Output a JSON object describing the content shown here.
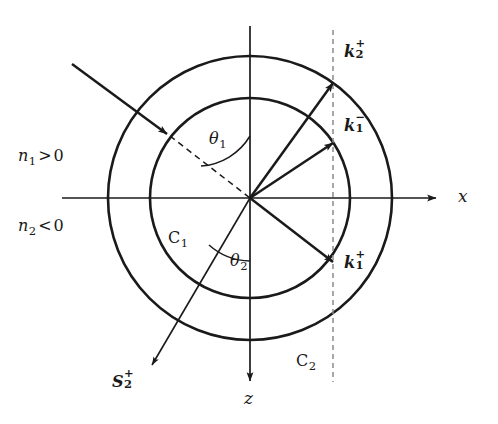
{
  "figure": {
    "kind": "wavevector-diagram",
    "colors": {
      "stroke": "#1a1a1a",
      "background": "#ffffff",
      "dashed_guide": "#8a8a8a"
    }
  },
  "axes": {
    "x_label": "x",
    "z_label": "z",
    "origin": {
      "x": 250,
      "y": 198
    }
  },
  "media": {
    "upper": {
      "label_prefix": "n",
      "label_sub": "1",
      "relation": ">",
      "value": "0",
      "full": "n1 > 0"
    },
    "lower": {
      "label_prefix": "n",
      "label_sub": "2",
      "relation": "<",
      "value": "0",
      "full": "n2 < 0"
    }
  },
  "circles": [
    {
      "name": "C1",
      "label_prefix": "C",
      "label_sub": "1",
      "radius": 100,
      "label_x": 168,
      "label_y": 230
    },
    {
      "name": "C2",
      "label_prefix": "C",
      "label_sub": "2",
      "radius": 142,
      "label_x": 296,
      "label_y": 353
    }
  ],
  "angles": [
    {
      "name": "theta1",
      "glyph": "θ",
      "sub": "1",
      "label_x": 209,
      "label_y": 131,
      "from": "upward z-axis",
      "to": "incident dashed ray"
    },
    {
      "name": "theta2",
      "glyph": "θ",
      "sub": "2",
      "label_x": 230,
      "label_y": 253,
      "from": "downward z-axis",
      "to": "refracted energy ray"
    }
  ],
  "vectors": [
    {
      "name": "k2plus",
      "symbol": "k",
      "sub": "2",
      "sup": "+",
      "tip": {
        "x": 333,
        "y": 83
      },
      "label_x": 344,
      "label_y": 44,
      "on_circle": "C2",
      "weight": "thick"
    },
    {
      "name": "k1minus",
      "symbol": "k",
      "sub": "1",
      "sup": "−",
      "tip": {
        "x": 333,
        "y": 143
      },
      "label_x": 344,
      "label_y": 118,
      "on_circle": "C1",
      "weight": "thick"
    },
    {
      "name": "k1plus",
      "symbol": "k",
      "sub": "1",
      "sup": "+",
      "tip": {
        "x": 333,
        "y": 262
      },
      "label_x": 344,
      "label_y": 255,
      "on_circle": "C1",
      "weight": "thick"
    },
    {
      "name": "S2plus",
      "symbol": "S",
      "sub": "2",
      "sup": "+",
      "tip": {
        "x": 152,
        "y": 365
      },
      "label_x": 112,
      "label_y": 374,
      "on_circle": null,
      "weight": "thin"
    }
  ],
  "incident_ray": {
    "name": "incident-ray",
    "start": {
      "x": 72,
      "y": 64
    },
    "arrow_tip": {
      "x": 167,
      "y": 134
    },
    "dashed_continues_to_origin": true
  },
  "tangential_guide": {
    "name": "kx-conservation-line",
    "x": 333,
    "style": "dashed",
    "top_y": 30,
    "bottom_y": 382
  }
}
